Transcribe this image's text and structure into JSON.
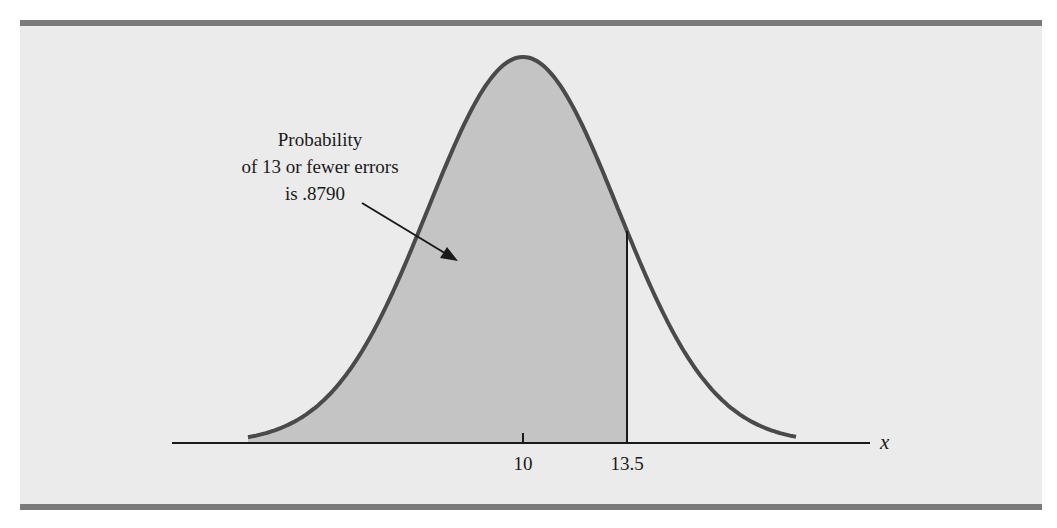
{
  "chart_data": {
    "type": "area",
    "title": "",
    "distribution": "normal",
    "mean": 10,
    "xlabel": "x",
    "ylabel": "",
    "x_ticks": [
      {
        "value": 10,
        "label": "10"
      },
      {
        "value": 13.5,
        "label": "13.5"
      }
    ],
    "shaded_region": {
      "from": "left tail",
      "to": 13.5,
      "probability": 0.879
    },
    "annotation": {
      "lines": [
        "Probability",
        "of 13 or fewer errors",
        "is .8790"
      ],
      "arrow_points_to": "shaded area"
    },
    "grid": false,
    "legend": "none"
  },
  "figure": {
    "annotation_line1": "Probability",
    "annotation_line2": "of 13 or fewer errors",
    "annotation_line3": "is .8790",
    "tick_10": "10",
    "tick_13_5": "13.5",
    "axis_label": "x"
  },
  "colors": {
    "panel_background": "#ebebeb",
    "panel_border": "#7a7a7a",
    "shaded_area": "#c4c4c4",
    "curve": "#4a4a4a",
    "axis": "#1a1a1a"
  }
}
